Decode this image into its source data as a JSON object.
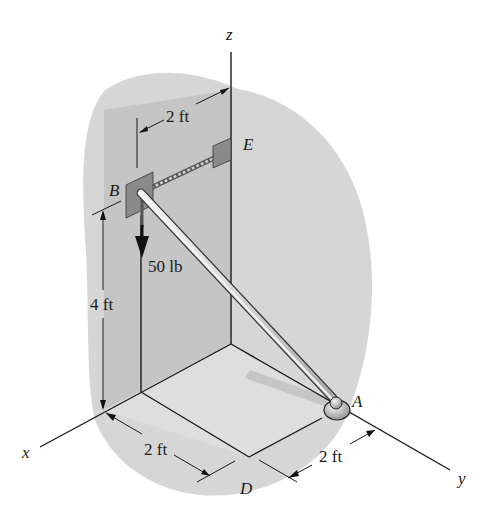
{
  "figure": {
    "type": "3D statics diagram",
    "axes": {
      "x": "x",
      "y": "y",
      "z": "z"
    },
    "points": {
      "A": "A",
      "B": "B",
      "D": "D",
      "E": "E"
    },
    "dimensions": {
      "BE_horizontal": "2 ft",
      "B_height": "4 ft",
      "x_offset_D": "2 ft",
      "y_offset_A": "2 ft"
    },
    "load": "50 lb",
    "colors": {
      "wall_shade": "#c4c4c4",
      "floor_shade": "#dcdcdc",
      "bracket": "#8a8a8a",
      "rod": "#e0e0e0",
      "line": "#1a1a1a"
    }
  }
}
